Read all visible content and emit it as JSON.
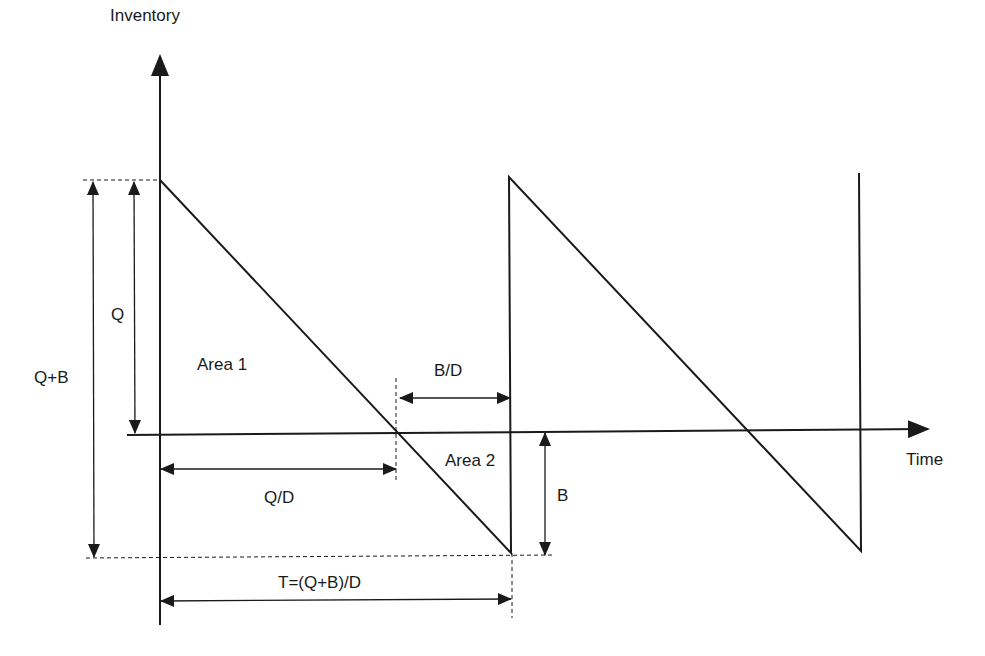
{
  "diagram": {
    "axes": {
      "y_label": "Inventory",
      "x_label": "Time"
    },
    "regions": {
      "area1": "Area 1",
      "area2": "Area 2"
    },
    "dimensions": {
      "q": "Q",
      "q_plus_b": "Q+B",
      "b": "B",
      "q_over_d": "Q/D",
      "b_over_d": "B/D",
      "cycle_time": "T=(Q+B)/D"
    },
    "colors": {
      "line": "#1a1a1a",
      "background": "#ffffff"
    },
    "sawtooth_cycles": 2.5
  }
}
